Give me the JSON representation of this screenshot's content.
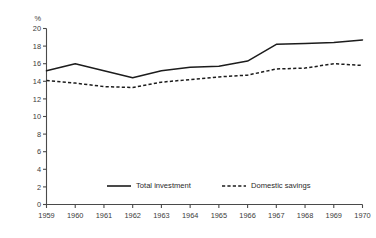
{
  "chart_data": {
    "type": "line",
    "title": "",
    "subtitle": "",
    "xlabel": "",
    "ylabel": "",
    "unit_label": "%",
    "categories": [
      "1959",
      "1960",
      "1961",
      "1962",
      "1963",
      "1964",
      "1965",
      "1966",
      "1967",
      "1968",
      "1969",
      "1970"
    ],
    "x": [
      1959,
      1960,
      1961,
      1962,
      1963,
      1964,
      1965,
      1966,
      1967,
      1968,
      1969,
      1970
    ],
    "xlim": [
      1959,
      1970
    ],
    "ylim": [
      0,
      20
    ],
    "y_ticks": [
      0,
      2,
      4,
      6,
      8,
      10,
      12,
      14,
      16,
      18,
      20
    ],
    "y_tick_labels": [
      "0",
      "2",
      "4",
      "6",
      "8",
      "10",
      "12",
      "14",
      "16",
      "18",
      "20"
    ],
    "grid": false,
    "legend_position": "bottom",
    "series": [
      {
        "name": "Total investment",
        "style": "solid",
        "color": "#1c1c1c",
        "values": [
          15.2,
          16.0,
          15.2,
          14.4,
          15.2,
          15.6,
          15.7,
          16.3,
          18.2,
          18.3,
          18.4,
          18.7
        ]
      },
      {
        "name": "Domestic savings",
        "style": "dashed",
        "color": "#1c1c1c",
        "values": [
          14.1,
          13.8,
          13.4,
          13.3,
          13.9,
          14.2,
          14.5,
          14.7,
          15.4,
          15.5,
          16.0,
          15.8
        ]
      }
    ]
  },
  "legend": {
    "items": [
      {
        "label": "Total investment",
        "style": "solid"
      },
      {
        "label": "Domestic savings",
        "style": "dashed"
      }
    ]
  }
}
